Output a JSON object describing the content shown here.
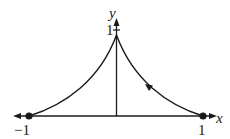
{
  "diagram": {
    "type": "parametric-curve",
    "axes": {
      "x_label": "x",
      "y_label": "y",
      "x_tick_labels": [
        "-1",
        "1"
      ],
      "y_tick_labels": [
        "1"
      ]
    },
    "points": [
      {
        "name": "left-endpoint",
        "x": -1,
        "y": 0
      },
      {
        "name": "right-endpoint",
        "x": 1,
        "y": 0
      },
      {
        "name": "cusp",
        "x": 0,
        "y": 1
      }
    ],
    "labels": {
      "x_axis": "x",
      "y_axis": "y",
      "neg_one": "−1",
      "pos_one": "1",
      "y_one": "1"
    },
    "colors": {
      "stroke": "#1a1a1a",
      "background": "#ffffff"
    }
  }
}
